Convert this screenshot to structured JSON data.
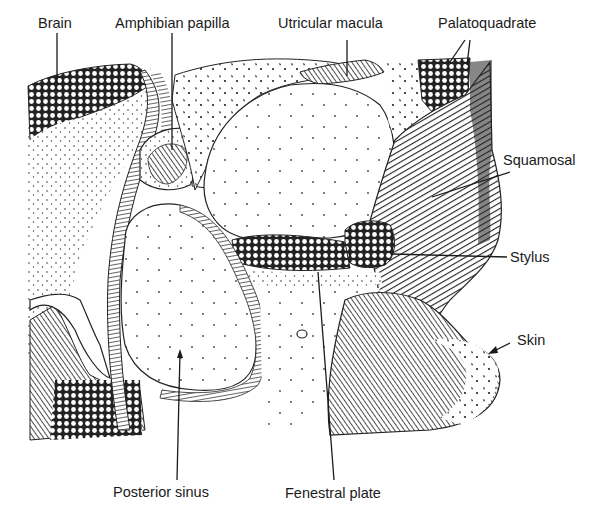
{
  "figure": {
    "type": "anatomical cross-section illustration",
    "labels": {
      "brain": "Brain",
      "amphibian_papilla": "Amphibian papilla",
      "utricular_macula": "Utricular macula",
      "palatoquadrate": "Palatoquadrate",
      "squamosal": "Squamosal",
      "stylus": "Stylus",
      "skin": "Skin",
      "posterior_sinus": "Posterior sinus",
      "fenestral_plate": "Fenestral plate"
    },
    "colors": {
      "ink": "#1a1a1a",
      "paper": "#ffffff"
    }
  }
}
